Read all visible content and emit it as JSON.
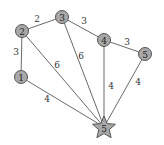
{
  "graph": {
    "nodes": [
      {
        "id": "1",
        "label": "1",
        "x": 21,
        "y": 77,
        "shape": "circle"
      },
      {
        "id": "2",
        "label": "2",
        "x": 22,
        "y": 31,
        "shape": "circle"
      },
      {
        "id": "3",
        "label": "3",
        "x": 62,
        "y": 17,
        "shape": "circle"
      },
      {
        "id": "4",
        "label": "4",
        "x": 104,
        "y": 40,
        "shape": "circle"
      },
      {
        "id": "5",
        "label": "5",
        "x": 145,
        "y": 54,
        "shape": "circle"
      },
      {
        "id": "S",
        "label": "5",
        "x": 104,
        "y": 127,
        "shape": "star"
      }
    ],
    "edges": [
      {
        "from": "2",
        "to": "3",
        "weight": "2",
        "lx": 37,
        "ly": 19
      },
      {
        "from": "2",
        "to": "1",
        "weight": "3",
        "lx": 16,
        "ly": 52
      },
      {
        "from": "2",
        "to": "S",
        "weight": "6",
        "lx": 57,
        "ly": 65
      },
      {
        "from": "3",
        "to": "S",
        "weight": "6",
        "lx": 81,
        "ly": 56
      },
      {
        "from": "3",
        "to": "4",
        "weight": "3",
        "lx": 84,
        "ly": 21
      },
      {
        "from": "4",
        "to": "5",
        "weight": "3",
        "lx": 127,
        "ly": 42
      },
      {
        "from": "4",
        "to": "S",
        "weight": "4",
        "lx": 111,
        "ly": 86
      },
      {
        "from": "5",
        "to": "S",
        "weight": "4",
        "lx": 138,
        "ly": 82
      },
      {
        "from": "1",
        "to": "S",
        "weight": "4",
        "lx": 47,
        "ly": 99
      }
    ],
    "colors": {
      "node_fill": "#a8a8a8",
      "node_stroke": "#555555",
      "edge": "#6a6a6a"
    }
  }
}
